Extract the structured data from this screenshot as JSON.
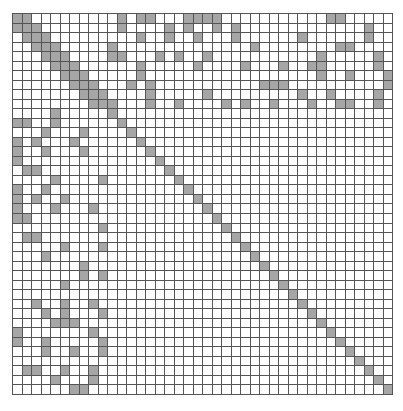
{
  "diagram": {
    "type": "sparsity-matrix",
    "rows": 40,
    "cols": 40,
    "filled_color": "#a6a6a6",
    "empty_color": "#ffffff",
    "grid_line_color": "#555555",
    "filled_cells_by_row": [
      [
        0,
        1,
        11,
        13,
        14,
        18,
        19,
        20,
        21,
        33,
        34
      ],
      [
        0,
        1,
        2,
        11,
        16,
        18,
        21,
        23,
        37
      ],
      [
        1,
        2,
        3,
        13,
        16,
        19,
        23,
        30,
        37
      ],
      [
        2,
        3,
        4,
        10,
        25,
        34,
        35
      ],
      [
        3,
        4,
        5,
        10,
        11,
        15,
        17,
        20,
        32,
        38
      ],
      [
        4,
        5,
        6,
        13,
        19,
        24,
        28,
        31,
        32,
        38
      ],
      [
        5,
        6,
        7,
        13,
        32,
        35,
        39
      ],
      [
        6,
        7,
        8,
        12,
        14,
        26,
        27,
        28,
        39
      ],
      [
        7,
        8,
        9,
        14,
        20,
        30,
        33,
        38
      ],
      [
        8,
        9,
        10,
        14,
        17,
        22,
        24,
        27,
        31,
        34,
        35,
        38
      ],
      [
        4,
        10
      ],
      [
        0,
        1,
        4,
        11
      ],
      [
        3,
        7,
        12
      ],
      [
        0,
        2,
        6,
        13
      ],
      [
        0,
        3,
        7,
        14
      ],
      [
        0,
        15
      ],
      [
        1,
        2,
        16
      ],
      [
        4,
        9,
        17
      ],
      [
        0,
        3,
        18
      ],
      [
        0,
        2,
        5,
        19
      ],
      [
        0,
        4,
        8,
        20
      ],
      [
        0,
        1,
        21
      ],
      [
        9,
        22
      ],
      [
        1,
        2,
        23
      ],
      [
        5,
        9,
        24
      ],
      [
        3,
        25
      ],
      [
        7,
        26
      ],
      [
        7,
        9,
        27
      ],
      [
        5,
        28
      ],
      [
        29
      ],
      [
        2,
        5,
        8,
        30
      ],
      [
        3,
        5,
        9,
        31
      ],
      [
        4,
        5,
        6,
        32
      ],
      [
        0,
        8,
        33
      ],
      [
        0,
        3,
        9,
        34
      ],
      [
        3,
        6,
        9,
        35
      ],
      [
        36
      ],
      [
        1,
        2,
        5,
        8,
        37
      ],
      [
        4,
        8,
        38
      ],
      [
        6,
        7,
        39
      ]
    ]
  }
}
